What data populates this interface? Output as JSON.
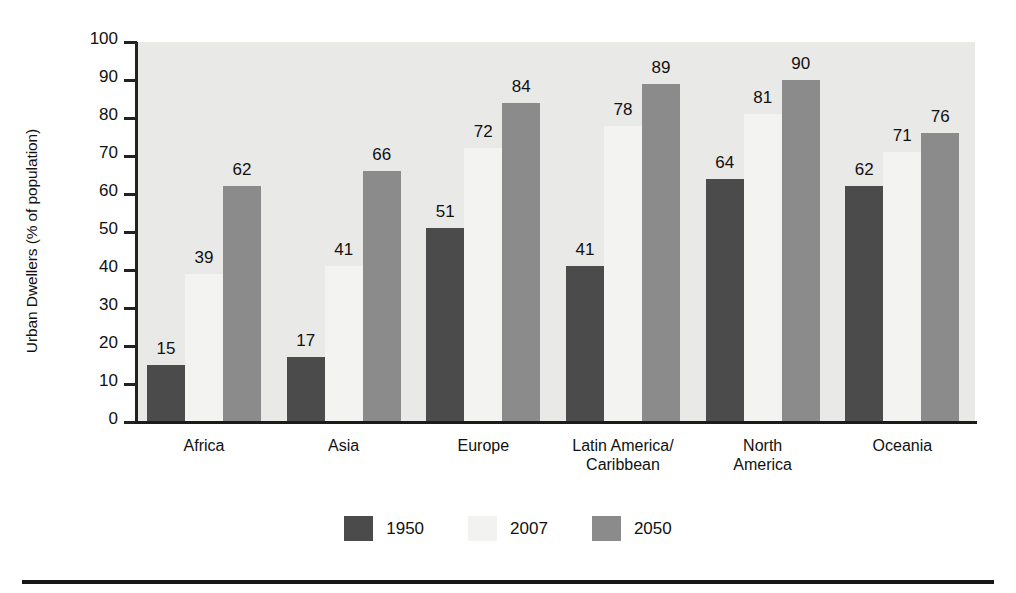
{
  "chart_data": {
    "type": "bar",
    "title": "",
    "subtitle": "",
    "xlabel": "",
    "ylabel": "Urban Dwellers (% of population)",
    "ylim": [
      0,
      100
    ],
    "ytick_step": 10,
    "yticks": [
      "100",
      "90",
      "80",
      "70",
      "60",
      "50",
      "40",
      "30",
      "20",
      "10",
      "0"
    ],
    "grid": false,
    "legend_position": "bottom-center",
    "categories": [
      "Africa",
      "Asia",
      "Europe",
      "Latin America/\nCaribbean",
      "North\nAmerica",
      "Oceania"
    ],
    "series": [
      {
        "name": "1950",
        "color": "#4b4b4b",
        "values": [
          15,
          17,
          51,
          41,
          64,
          62
        ]
      },
      {
        "name": "2007",
        "color": "#f3f3f1",
        "values": [
          39,
          41,
          72,
          78,
          81,
          71
        ]
      },
      {
        "name": "2050",
        "color": "#8b8b8b",
        "values": [
          62,
          66,
          84,
          89,
          90,
          76
        ]
      }
    ]
  },
  "legend": {
    "items": [
      {
        "label": "1950",
        "color": "#4b4b4b"
      },
      {
        "label": "2007",
        "color": "#f3f3f1"
      },
      {
        "label": "2050",
        "color": "#8b8b8b"
      }
    ]
  },
  "colors": {
    "plot_background": "#e9e9e7",
    "page_background": "#ffffff",
    "axis": "#1b1b1b",
    "text": "#111111"
  }
}
